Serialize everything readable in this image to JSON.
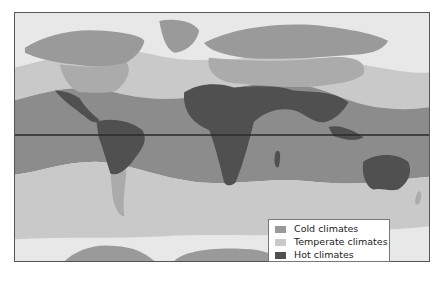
{
  "map": {
    "type": "world-climate-zones",
    "equator_line": true,
    "colors": {
      "cold_ocean": "#e8e8e8",
      "cold_land": "#9a9a9a",
      "temperate_ocean": "#c9c9c9",
      "temperate_land": "#ababab",
      "hot_ocean": "#8c8c8c",
      "hot_land": "#505050",
      "equator": "#2a2a2a"
    }
  },
  "legend": {
    "items": [
      {
        "label": "Cold climates",
        "color": "#9a9a9a"
      },
      {
        "label": "Temperate climates",
        "color": "#c9c9c9"
      },
      {
        "label": "Hot climates",
        "color": "#505050"
      }
    ]
  }
}
